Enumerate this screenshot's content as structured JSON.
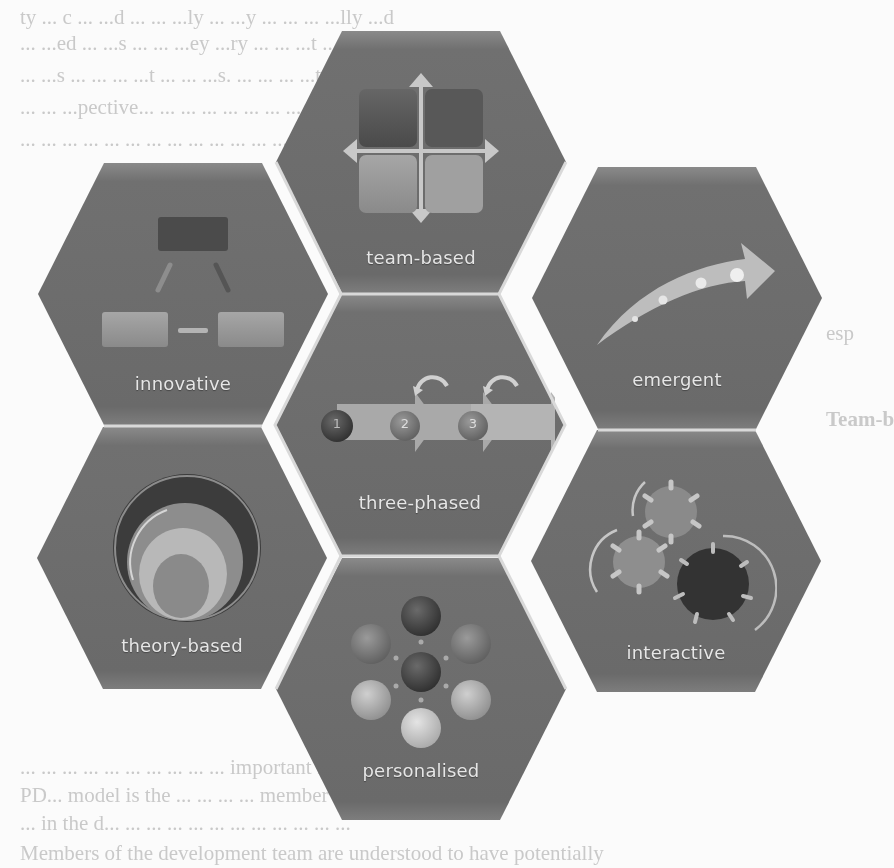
{
  "background_text": {
    "lines": [
      {
        "x": 20,
        "y": 2,
        "text": "ty ... c ... ...d ... ... ...ly ... ...y ... ... ... ...lly ...d"
      },
      {
        "x": 20,
        "y": 28,
        "text": "... ...ed ... ...s ... ... ...ey ...ry ... ... ...t ... ..."
      },
      {
        "x": 20,
        "y": 60,
        "text": "... ...s ... ... ... ...t ... ... ...s. ... ... ... ...t ... ..."
      },
      {
        "x": 20,
        "y": 92,
        "text": "... ... ...pective... ... ... ... ... ... ... ... ... ... ..."
      },
      {
        "x": 20,
        "y": 124,
        "text": "... ... ... ... ... ... ... ... ... ... ... ... ... ... ..."
      },
      {
        "x": 826,
        "y": 318,
        "text": "esp"
      },
      {
        "x": 826,
        "y": 404,
        "text": "Team-b"
      },
      {
        "x": 20,
        "y": 752,
        "text": "... ... ... ... ... ... ... ... ... ...  important feature of the"
      },
      {
        "x": 20,
        "y": 780,
        "text": "PD... model is the ... ... ... ... member will have ... ..."
      },
      {
        "x": 20,
        "y": 808,
        "text": "... in the d... ... ... ... ... ... ... ... ... ... ... ..."
      },
      {
        "x": 20,
        "y": 838,
        "text": "Members of the development team are understood to have potentially"
      }
    ]
  },
  "diagram": {
    "hex_fill": "#6f6f6f",
    "hex_fill_light": "#7a7a7a",
    "hex_gap": "#d9d9d9",
    "label_color": "#e6e6e6",
    "hexagons": [
      {
        "id": "team-based",
        "label": "team-based",
        "icon": "four-squares-arrows-icon",
        "x": 276,
        "y": 31
      },
      {
        "id": "innovative",
        "label": "innovative",
        "icon": "hierarchy-boxes-icon",
        "x": 38,
        "y": 163
      },
      {
        "id": "emergent",
        "label": "emergent",
        "icon": "curved-arrow-icon",
        "x": 532,
        "y": 167
      },
      {
        "id": "three-phased",
        "label": "three-phased",
        "icon": "three-step-arrows-icon",
        "x": 275,
        "y": 294
      },
      {
        "id": "theory-based",
        "label": "theory-based",
        "icon": "concentric-circles-icon",
        "x": 37,
        "y": 427
      },
      {
        "id": "interactive",
        "label": "interactive",
        "icon": "gears-icon",
        "x": 531,
        "y": 430
      },
      {
        "id": "personalised",
        "label": "personalised",
        "icon": "radial-circles-icon",
        "x": 276,
        "y": 558
      }
    ],
    "phases": [
      "1",
      "2",
      "3"
    ]
  }
}
